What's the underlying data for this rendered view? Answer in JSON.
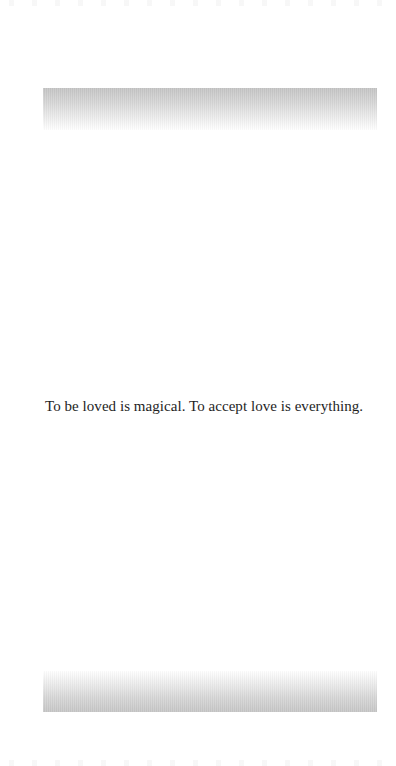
{
  "page": {
    "quote": "To be loved is magical. To accept love is everything."
  },
  "decorations": {
    "top_band": "gray-gradient-band",
    "bottom_band": "gray-gradient-band"
  },
  "colors": {
    "background": "#ffffff",
    "text": "#1e1e1e",
    "band_gray": "#c4c4c4"
  }
}
